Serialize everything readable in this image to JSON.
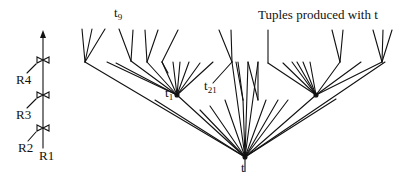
{
  "title": "Tuples produced with t",
  "plan": {
    "relations": [
      "R1",
      "R2",
      "R3",
      "R4"
    ],
    "joins": 3,
    "output_arrow": "up-arrow"
  },
  "tree": {
    "root": {
      "label": "t",
      "x": 245,
      "y": 157
    },
    "nodes": [
      {
        "label": "t",
        "sub": "1",
        "x": 177,
        "y": 95
      },
      {
        "label": "t",
        "sub": "21",
        "x": 213,
        "y": 85
      },
      {
        "label": "t",
        "sub": "9",
        "x": 130,
        "y": 14
      }
    ]
  },
  "labels": {
    "t": "t",
    "t1_base": "t",
    "t1_sub": "1",
    "t21_base": "t",
    "t21_sub": "21",
    "t9_base": "t",
    "t9_sub": "9",
    "R1": "R1",
    "R2": "R2",
    "R3": "R3",
    "R4": "R4"
  },
  "colors": {
    "stroke": "#111111",
    "background": "#ffffff"
  }
}
